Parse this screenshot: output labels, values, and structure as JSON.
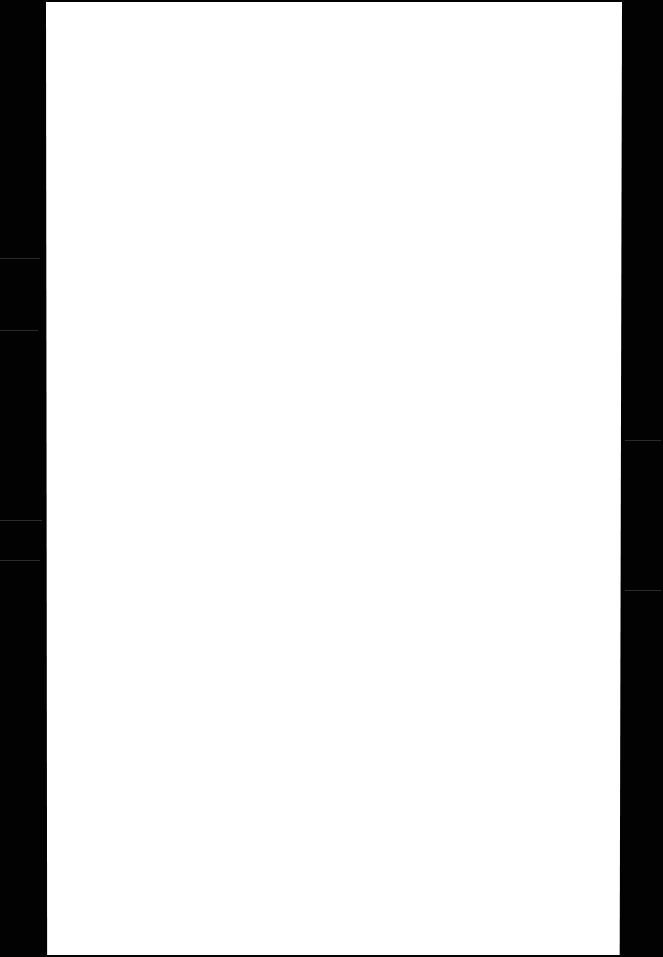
{
  "document": {
    "type": "scanned-page",
    "content": "",
    "page_color": "#ffffff",
    "background_color": "#000000"
  }
}
